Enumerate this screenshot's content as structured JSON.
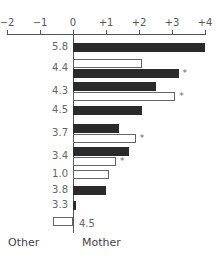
{
  "chart_data": {
    "type": "bar",
    "orientation": "horizontal",
    "title": "",
    "xlabel": "",
    "ylabel": "",
    "xlim": [
      -2,
      4
    ],
    "x_ticks": [
      "−2",
      "−1",
      "0",
      "+1",
      "+2",
      "+3",
      "+4"
    ],
    "grid": false,
    "legend": {
      "position": "bottom",
      "entries": [
        "Other",
        "Mother"
      ]
    },
    "rows": [
      {
        "label": "5.8",
        "bars": [
          {
            "style": "dark",
            "value": 4.0,
            "star": false
          }
        ]
      },
      {
        "label": "4.4",
        "bars": [
          {
            "style": "light",
            "value": 2.1,
            "star": false
          },
          {
            "style": "dark",
            "value": 3.2,
            "star": true
          }
        ]
      },
      {
        "label": "4.3",
        "bars": [
          {
            "style": "dark",
            "value": 2.5,
            "star": false
          },
          {
            "style": "light",
            "value": 3.1,
            "star": true
          }
        ]
      },
      {
        "label": "4.5",
        "bars": [
          {
            "style": "dark",
            "value": 2.1,
            "star": false
          }
        ]
      },
      {
        "label": "3.7",
        "bars": [
          {
            "style": "dark",
            "value": 1.4,
            "star": false
          },
          {
            "style": "light",
            "value": 1.9,
            "star": true
          }
        ]
      },
      {
        "label": "3.4",
        "bars": [
          {
            "style": "dark",
            "value": 1.7,
            "star": false
          },
          {
            "style": "light",
            "value": 1.3,
            "star": true
          }
        ]
      },
      {
        "label": "1.0",
        "bars": [
          {
            "style": "light",
            "value": 1.1,
            "star": false
          }
        ]
      },
      {
        "label": "3.8",
        "bars": [
          {
            "style": "dark",
            "value": 1.0,
            "star": false
          }
        ]
      },
      {
        "label": "3.3",
        "bars": [
          {
            "style": "dark",
            "value": 0.1,
            "star": false
          }
        ]
      },
      {
        "label": "4.5",
        "bars": [
          {
            "style": "light",
            "value": -0.6,
            "star": false
          }
        ],
        "label_side": "right"
      }
    ],
    "star_symbol": "*"
  },
  "legend": {
    "left": "Other",
    "right": "Mother"
  }
}
